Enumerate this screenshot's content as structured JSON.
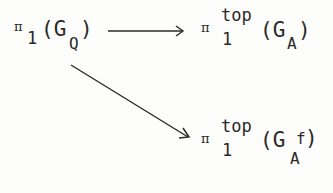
{
  "diagram": {
    "type": "commutative-diagram",
    "nodes": [
      {
        "id": "source",
        "symbol": "π",
        "subscript": "1",
        "superscript": "",
        "open": "(G",
        "group_subscript": "Q",
        "group_superscript": "",
        "close": ")",
        "latex": "\\pi_1(G_Q)"
      },
      {
        "id": "target-top",
        "symbol": "π",
        "subscript": "1",
        "superscript": "top",
        "open": "(G",
        "group_subscript": "A",
        "group_superscript": "",
        "close": ")",
        "latex": "\\pi_1^{top}(G_A)"
      },
      {
        "id": "target-bottom",
        "symbol": "π",
        "subscript": "1",
        "superscript": "top",
        "open": "(G",
        "group_subscript": "A",
        "group_superscript": "f",
        "close": ")",
        "latex": "\\pi_1^{top}(G_{A^f})"
      }
    ],
    "edges": [
      {
        "from": "source",
        "to": "target-top",
        "style": "horizontal arrow"
      },
      {
        "from": "source",
        "to": "target-bottom",
        "style": "diagonal arrow"
      }
    ],
    "colors": {
      "ink": "#2a2a2a",
      "paper": "#fdfdfb"
    }
  }
}
